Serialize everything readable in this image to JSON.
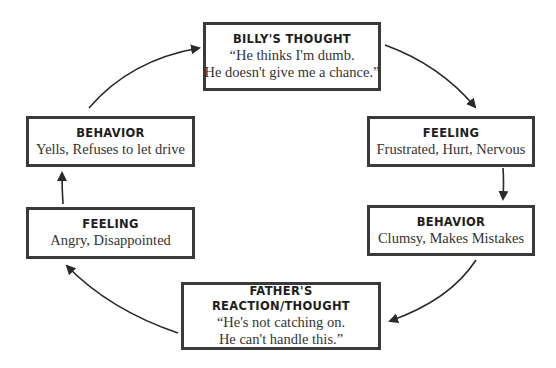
{
  "diagram": {
    "type": "cycle",
    "colors": {
      "border": "#3a3a3a",
      "arrow": "#2a2a2a",
      "text": "#333333"
    },
    "nodes": [
      {
        "id": "billys-thought",
        "title": "BILLY'S THOUGHT",
        "lines": [
          "“He thinks I'm dumb.",
          "He doesn't give me a chance.”"
        ]
      },
      {
        "id": "billy-feeling",
        "title": "FEELING",
        "lines": [
          "Frustrated, Hurt, Nervous"
        ]
      },
      {
        "id": "billy-behavior",
        "title": "BEHAVIOR",
        "lines": [
          "Clumsy, Makes Mistakes"
        ]
      },
      {
        "id": "father-reaction",
        "title": "FATHER'S REACTION/THOUGHT",
        "lines": [
          "“He's not catching on.",
          "He can't handle this.”"
        ]
      },
      {
        "id": "father-feeling",
        "title": "FEELING",
        "lines": [
          "Angry, Disappointed"
        ]
      },
      {
        "id": "father-behavior",
        "title": "BEHAVIOR",
        "lines": [
          "Yells, Refuses to let drive"
        ]
      }
    ],
    "edges": [
      {
        "from": "billys-thought",
        "to": "billy-feeling"
      },
      {
        "from": "billy-feeling",
        "to": "billy-behavior"
      },
      {
        "from": "billy-behavior",
        "to": "father-reaction"
      },
      {
        "from": "father-reaction",
        "to": "father-feeling"
      },
      {
        "from": "father-feeling",
        "to": "father-behavior"
      },
      {
        "from": "father-behavior",
        "to": "billys-thought"
      }
    ]
  }
}
